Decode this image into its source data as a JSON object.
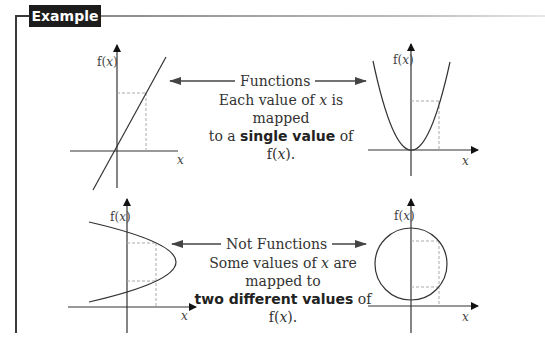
{
  "example": {
    "label": "Example 1"
  },
  "functions_section": {
    "arrow_label": "Functions",
    "caption_line1_pre": "Each value of ",
    "caption_var": "x",
    "caption_line1_post": " is mapped",
    "caption_line2_pre": "to a ",
    "caption_bold": "single value",
    "caption_line2_post": " of f(",
    "caption_line2_var": "x",
    "caption_line2_end": ")."
  },
  "not_functions_section": {
    "arrow_label": "Not Functions",
    "caption_line1_pre": "Some values of ",
    "caption_var": "x",
    "caption_line1_post": " are mapped to",
    "caption_bold": "two different values",
    "caption_line2_post": " of f(",
    "caption_line2_var": "x",
    "caption_line2_end": ")."
  },
  "graphs": [
    {
      "name": "straight line",
      "y_label": "f(x)",
      "x_label": "x",
      "type": "function"
    },
    {
      "name": "parabola",
      "y_label": "f(x)",
      "x_label": "x",
      "type": "function"
    },
    {
      "name": "sideways parabola",
      "y_label": "f(x)",
      "x_label": "x",
      "type": "not function"
    },
    {
      "name": "circle",
      "y_label": "f(x)",
      "x_label": "x",
      "type": "not function"
    }
  ],
  "colors": {
    "label_bg": "#1c1c1c",
    "line": "#333333",
    "dashed": "#aaaaaa"
  }
}
